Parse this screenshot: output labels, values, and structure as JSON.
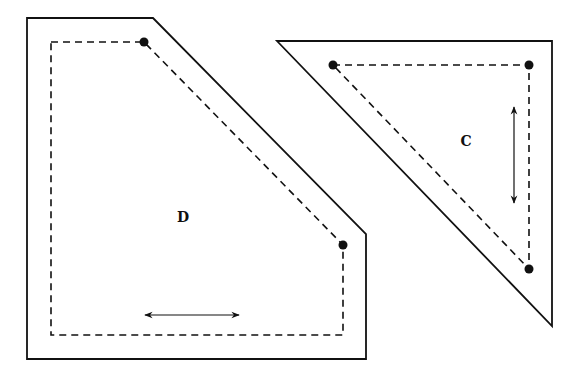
{
  "diagram": {
    "shapes": [
      {
        "id": "D",
        "label": "D",
        "outer_polygon": [
          [
            27,
            18
          ],
          [
            153,
            18
          ],
          [
            366,
            234
          ],
          [
            366,
            359
          ],
          [
            27,
            359
          ]
        ],
        "dashed_path": [
          [
            51,
            42
          ],
          [
            144,
            42
          ],
          [
            343,
            245
          ],
          [
            343,
            335
          ],
          [
            51,
            335
          ],
          [
            51,
            42
          ]
        ],
        "dots": [
          [
            144,
            42
          ],
          [
            343,
            245
          ]
        ],
        "arrow": {
          "from": [
            143,
            315
          ],
          "to": [
            241,
            315
          ],
          "direction": "horizontal-double"
        },
        "label_pos": [
          183,
          222
        ]
      },
      {
        "id": "C",
        "label": "C",
        "outer_polygon": [
          [
            277,
            41
          ],
          [
            552,
            41
          ],
          [
            552,
            326
          ]
        ],
        "dashed_path": [
          [
            333,
            65
          ],
          [
            529,
            65
          ],
          [
            529,
            269
          ],
          [
            333,
            65
          ]
        ],
        "dots": [
          [
            333,
            65
          ],
          [
            529,
            65
          ],
          [
            529,
            269
          ]
        ],
        "arrow": {
          "from": [
            514,
            105
          ],
          "to": [
            514,
            205
          ],
          "direction": "vertical-double"
        },
        "label_pos": [
          466,
          146
        ]
      }
    ],
    "colors": {
      "stroke": "#111111",
      "background": "#ffffff"
    }
  }
}
